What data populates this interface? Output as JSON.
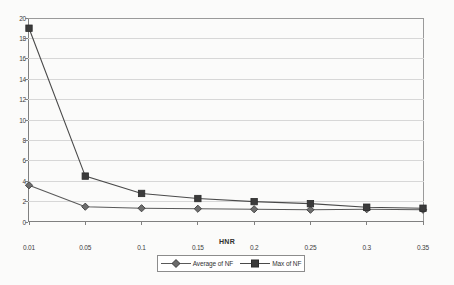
{
  "chart_data": {
    "type": "line",
    "title": "",
    "xlabel": "HNR",
    "ylabel": "",
    "categories": [
      "0.01",
      "0.05",
      "0.1",
      "0.15",
      "0.2",
      "0.25",
      "0.3",
      "0.35"
    ],
    "ylim": [
      0,
      20
    ],
    "yticks": [
      "0",
      "2",
      "4",
      "6",
      "8",
      "10",
      "12",
      "14",
      "16",
      "18",
      "20"
    ],
    "grid": "horizontal",
    "legend_position": "bottom",
    "series": [
      {
        "name": "Average of NF",
        "marker": "diamond",
        "color": "#595959",
        "values": [
          3.6,
          1.5,
          1.35,
          1.3,
          1.25,
          1.2,
          1.25,
          1.2
        ]
      },
      {
        "name": "Max of NF",
        "marker": "square",
        "color": "#4a4a4a",
        "values": [
          19.0,
          4.5,
          2.8,
          2.3,
          2.0,
          1.8,
          1.45,
          1.35
        ]
      }
    ]
  },
  "legend": {
    "entries": [
      {
        "label": "Average of NF"
      },
      {
        "label": "Max of NF"
      }
    ]
  },
  "colors": {
    "gridline": "#d7d7d7",
    "axis": "#808080",
    "series_average": "#595959",
    "series_max": "#4a4a4a",
    "background": "#fbfbfa"
  }
}
